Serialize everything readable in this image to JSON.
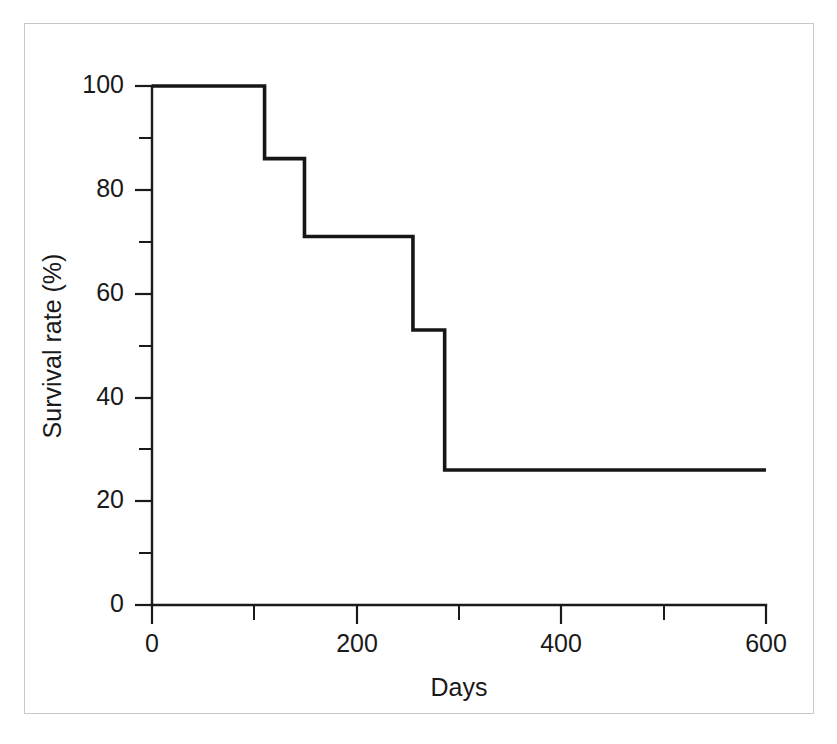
{
  "chart_data": {
    "type": "line",
    "subtype": "step-post",
    "title": "",
    "xlabel": "Days",
    "ylabel": "Survival rate (%)",
    "xlim": [
      0,
      600
    ],
    "ylim": [
      0,
      100
    ],
    "xticks": [
      0,
      200,
      400,
      600
    ],
    "xtick_labels": [
      "0",
      "200",
      "400",
      "600"
    ],
    "xticks_minor": [
      100,
      300,
      500
    ],
    "yticks": [
      0,
      20,
      40,
      60,
      80,
      100
    ],
    "ytick_labels": [
      "0",
      "20",
      "40",
      "60",
      "80",
      "100"
    ],
    "yticks_minor": [
      10,
      30,
      50,
      70,
      90
    ],
    "grid": false,
    "legend": "none",
    "series": [
      {
        "name": "Survival",
        "color": "#161616",
        "x": [
          0,
          110,
          110,
          149,
          149,
          255,
          255,
          286,
          286,
          600
        ],
        "y": [
          100,
          100,
          86,
          86,
          71,
          71,
          53,
          53,
          26,
          26
        ],
        "steps": [
          {
            "x_start": 0,
            "x_end": 110,
            "survival": 100
          },
          {
            "x_start": 110,
            "x_end": 149,
            "survival": 86
          },
          {
            "x_start": 149,
            "x_end": 255,
            "survival": 71
          },
          {
            "x_start": 255,
            "x_end": 286,
            "survival": 53
          },
          {
            "x_start": 286,
            "x_end": 600,
            "survival": 26
          }
        ]
      }
    ]
  },
  "axes": {
    "x_title": "Days",
    "y_title": "Survival rate (%)",
    "x_tick_0": "0",
    "x_tick_1": "200",
    "x_tick_2": "400",
    "x_tick_3": "600",
    "y_tick_0": "0",
    "y_tick_1": "20",
    "y_tick_2": "40",
    "y_tick_3": "60",
    "y_tick_4": "80",
    "y_tick_5": "100"
  },
  "colors": {
    "series": "#161616",
    "axis": "#1a1a1a",
    "frame": "#c8c8c8",
    "background": "#ffffff"
  }
}
